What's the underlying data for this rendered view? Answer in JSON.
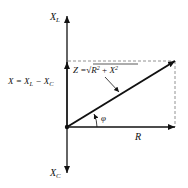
{
  "diagram": {
    "labels": {
      "xl": "X",
      "xl_sub": "L",
      "xc": "X",
      "xc_sub": "C",
      "x_eq_lhs": "X = X",
      "x_eq_sub1": "L",
      "x_eq_mid": " − X",
      "x_eq_sub2": "C",
      "z_lhs": "Z =",
      "z_radical": "√",
      "z_r": "R",
      "z_r_exp": "2",
      "z_plus": " + ",
      "z_x": "X",
      "z_x_exp": "2",
      "phi": "φ",
      "r": "R"
    },
    "colors": {
      "stroke": "#111111",
      "dashed": "#777777",
      "background": "#ffffff"
    }
  }
}
